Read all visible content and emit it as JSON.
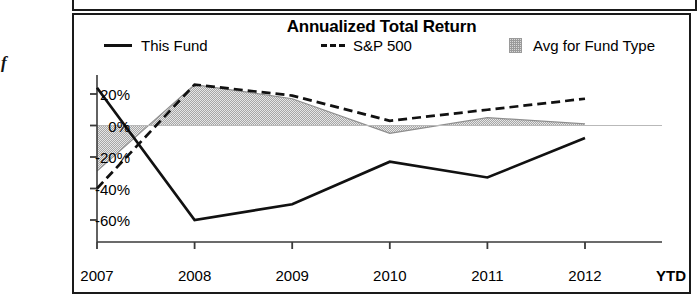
{
  "page": {
    "orphan_glyph": "f"
  },
  "chart": {
    "title": "Annualized Total Return",
    "ytd_label": "YTD",
    "legend": [
      {
        "key": "fund",
        "label": "This Fund",
        "marker": "solid-line-swatch",
        "color": "#111111"
      },
      {
        "key": "sp500",
        "label": "S&P 500",
        "marker": "dashed-line-swatch",
        "color": "#111111"
      },
      {
        "key": "avg",
        "label": "Avg for Fund Type",
        "marker": "shaded-box-swatch",
        "color": "#d8d8d8"
      }
    ]
  },
  "chart_data": {
    "type": "line",
    "title": "Annualized Total Return",
    "xlabel": "",
    "ylabel": "",
    "categories": [
      "2007",
      "2008",
      "2009",
      "2010",
      "2011",
      "2012"
    ],
    "x_tick_labels": [
      "2007",
      "2008",
      "2009",
      "2010",
      "2011",
      "2012"
    ],
    "y_tick_labels": [
      "20%",
      "0%",
      "-20%",
      "-40%",
      "-60%"
    ],
    "y_ticks": [
      20,
      0,
      -20,
      -40,
      -60
    ],
    "ylim": [
      -68,
      32
    ],
    "grid": false,
    "legend_position": "top",
    "zero_baseline": 0,
    "series": [
      {
        "name": "This Fund",
        "style": "solid",
        "color": "#111111",
        "values": [
          24,
          -60,
          -50,
          -23,
          -33,
          -8
        ]
      },
      {
        "name": "S&P 500",
        "style": "dashed",
        "color": "#111111",
        "values": [
          -40,
          26,
          19,
          3,
          10,
          17
        ]
      },
      {
        "name": "Avg for Fund Type",
        "style": "shaded-area",
        "color": "#d8d8d8",
        "fill_to": 0,
        "values": [
          -29,
          26,
          17,
          -5,
          5,
          1
        ]
      }
    ]
  }
}
